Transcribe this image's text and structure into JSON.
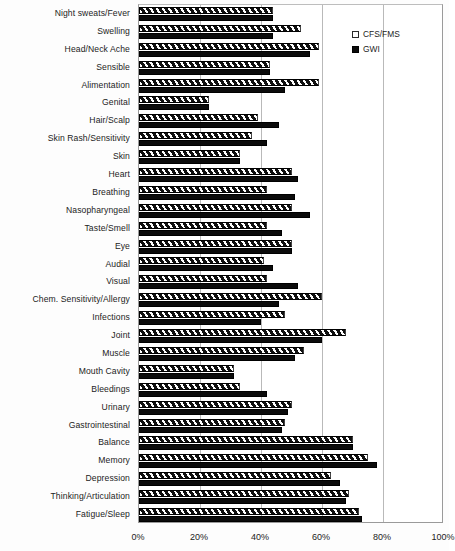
{
  "chart_data": {
    "type": "bar",
    "orientation": "horizontal",
    "title": "",
    "subtitle": "",
    "xlabel": "",
    "ylabel": "",
    "xlim": [
      0,
      100
    ],
    "xticks": [
      "0%",
      "20%",
      "40%",
      "60%",
      "80%",
      "100%"
    ],
    "xtick_values": [
      0,
      20,
      40,
      60,
      80,
      100
    ],
    "grid": true,
    "legend_position": "top-right",
    "categories": [
      "Night sweats/Fever",
      "Swelling",
      "Head/Neck Ache",
      "Sensible",
      "Alimentation",
      "Genital",
      "Hair/Scalp",
      "Skin Rash/Sensitivity",
      "Skin",
      "Heart",
      "Breathing",
      "Nasopharyngeal",
      "Taste/Smell",
      "Eye",
      "Audial",
      "Visual",
      "Chem. Sensitivity/Allergy",
      "Infections",
      "Joint",
      "Muscle",
      "Mouth Cavity",
      "Bleedings",
      "Urinary",
      "Gastrointestinal",
      "Balance",
      "Memory",
      "Depression",
      "Thinking/Articulation",
      "Fatigue/Sleep"
    ],
    "series": [
      {
        "name": "CFS/FMS",
        "pattern": "diagonal-hatch",
        "color": "#ffffff",
        "values": [
          44,
          53,
          59,
          43,
          59,
          23,
          39,
          37,
          33,
          50,
          42,
          50,
          42,
          50,
          41,
          42,
          60,
          48,
          68,
          54,
          31,
          33,
          50,
          48,
          70,
          75,
          63,
          69,
          72
        ]
      },
      {
        "name": "GWI",
        "pattern": "solid",
        "color": "#0b0b0b",
        "values": [
          44,
          44,
          56,
          43,
          48,
          23,
          46,
          42,
          33,
          52,
          51,
          56,
          47,
          50,
          44,
          52,
          46,
          40,
          60,
          51,
          31,
          42,
          49,
          47,
          70,
          78,
          66,
          68,
          73
        ]
      }
    ]
  }
}
